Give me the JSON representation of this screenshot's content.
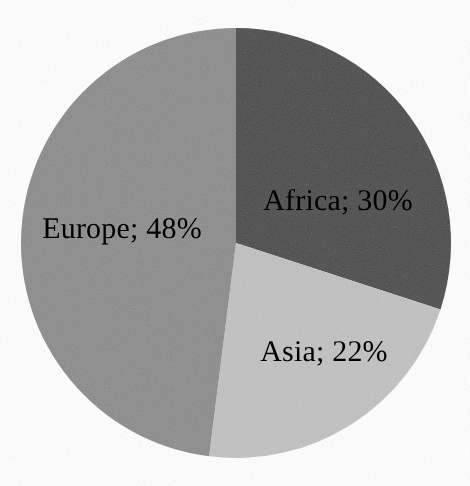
{
  "chart_data": {
    "type": "pie",
    "title": "",
    "subtitle": "",
    "xlabel": "",
    "ylabel": "",
    "legend_position": "none",
    "grid": false,
    "label_format": "Name; NN%",
    "label_separator": "; ",
    "start_angle_deg": 0,
    "direction": "clockwise",
    "categories": [
      "Africa",
      "Asia",
      "Europe"
    ],
    "values": [
      30,
      22,
      48
    ],
    "units": "%",
    "total": 100,
    "slices": [
      {
        "name": "Africa",
        "value": 30,
        "value_text": "30%",
        "label": "Africa; 30%",
        "color": "#4a4a4a",
        "start_angle_deg": 0,
        "end_angle_deg": 108,
        "label_x": 338,
        "label_y": 201
      },
      {
        "name": "Asia",
        "value": 22,
        "value_text": "22%",
        "label": "Asia; 22%",
        "color": "#c0c0c0",
        "start_angle_deg": 108,
        "end_angle_deg": 187.2,
        "label_x": 324,
        "label_y": 352
      },
      {
        "name": "Europe",
        "value": 48,
        "value_text": "48%",
        "label": "Europe; 48%",
        "color": "#8a8a8a",
        "start_angle_deg": 187.2,
        "end_angle_deg": 360,
        "label_x": 122,
        "label_y": 229
      }
    ],
    "geometry": {
      "center_x": 236,
      "center_y": 243,
      "radius": 215
    },
    "colors": {
      "background": "#ffffff",
      "label_text": "#000000",
      "africa": "#4a4a4a",
      "asia": "#c0c0c0",
      "europe": "#8a8a8a"
    }
  }
}
